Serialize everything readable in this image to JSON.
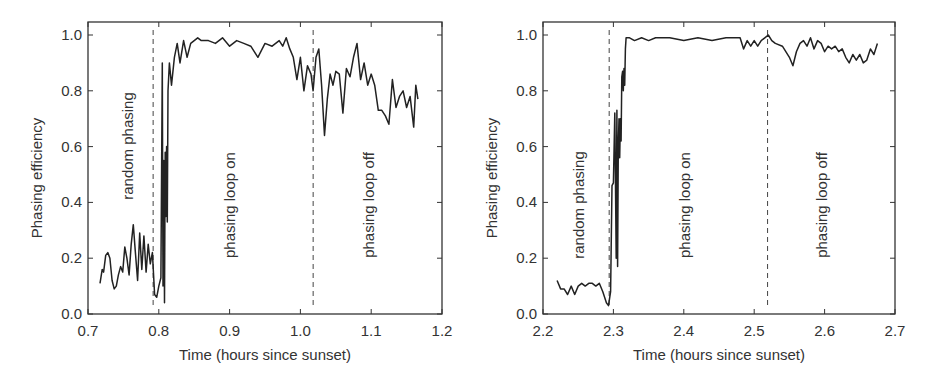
{
  "chart_data": [
    {
      "type": "line",
      "title": "",
      "xlabel": "Time (hours since sunset)",
      "ylabel": "Phasing efficiency",
      "xlim": [
        0.7,
        1.2
      ],
      "ylim": [
        0.0,
        1.05
      ],
      "xticks": [
        "0.7",
        "0.8",
        "0.9",
        "1.0",
        "1.1",
        "1.2"
      ],
      "yticks": [
        "0.0",
        "0.2",
        "0.4",
        "0.6",
        "0.8",
        "1.0"
      ],
      "grid": false,
      "vlines": [
        0.792,
        1.018
      ],
      "regions": [
        "random phasing",
        "phasing loop on",
        "phasing loop off"
      ],
      "series": [
        {
          "name": "phasing efficiency",
          "x": [
            0.717,
            0.72,
            0.722,
            0.725,
            0.728,
            0.731,
            0.734,
            0.737,
            0.74,
            0.743,
            0.746,
            0.749,
            0.752,
            0.755,
            0.758,
            0.761,
            0.764,
            0.767,
            0.77,
            0.773,
            0.776,
            0.779,
            0.782,
            0.785,
            0.788,
            0.791,
            0.794,
            0.797,
            0.8,
            0.803,
            0.805,
            0.806,
            0.807,
            0.808,
            0.809,
            0.81,
            0.811,
            0.812,
            0.813,
            0.815,
            0.818,
            0.822,
            0.826,
            0.83,
            0.835,
            0.84,
            0.845,
            0.85,
            0.855,
            0.86,
            0.87,
            0.88,
            0.89,
            0.9,
            0.91,
            0.92,
            0.93,
            0.94,
            0.95,
            0.96,
            0.97,
            0.975,
            0.98,
            0.985,
            0.99,
            0.995,
            1.0,
            1.005,
            1.01,
            1.015,
            1.018,
            1.022,
            1.026,
            1.03,
            1.034,
            1.038,
            1.042,
            1.046,
            1.05,
            1.055,
            1.06,
            1.065,
            1.07,
            1.075,
            1.08,
            1.085,
            1.09,
            1.095,
            1.1,
            1.105,
            1.11,
            1.115,
            1.12,
            1.125,
            1.13,
            1.135,
            1.14,
            1.145,
            1.15,
            1.155,
            1.16,
            1.163,
            1.166
          ],
          "y": [
            0.11,
            0.16,
            0.15,
            0.21,
            0.22,
            0.2,
            0.12,
            0.09,
            0.1,
            0.14,
            0.17,
            0.15,
            0.24,
            0.2,
            0.14,
            0.25,
            0.32,
            0.22,
            0.12,
            0.29,
            0.16,
            0.28,
            0.15,
            0.25,
            0.18,
            0.22,
            0.07,
            0.06,
            0.1,
            0.13,
            0.9,
            0.1,
            0.55,
            0.04,
            0.58,
            0.35,
            0.6,
            0.33,
            0.8,
            0.9,
            0.82,
            0.92,
            0.97,
            0.9,
            0.98,
            0.92,
            0.97,
            0.98,
            0.99,
            0.98,
            0.98,
            0.97,
            0.99,
            0.96,
            0.98,
            0.97,
            0.96,
            0.92,
            0.97,
            0.96,
            0.98,
            0.96,
            0.99,
            0.95,
            0.92,
            0.84,
            0.92,
            0.8,
            0.89,
            0.86,
            0.8,
            0.92,
            0.95,
            0.82,
            0.64,
            0.77,
            0.86,
            0.82,
            0.87,
            0.86,
            0.72,
            0.88,
            0.85,
            0.92,
            0.97,
            0.84,
            0.9,
            0.82,
            0.86,
            0.82,
            0.73,
            0.73,
            0.71,
            0.68,
            0.84,
            0.74,
            0.78,
            0.8,
            0.74,
            0.78,
            0.67,
            0.82,
            0.77
          ]
        }
      ]
    },
    {
      "type": "line",
      "title": "",
      "xlabel": "Time (hours since sunset)",
      "ylabel": "Phasing efficiency",
      "xlim": [
        2.2,
        2.7
      ],
      "ylim": [
        0.0,
        1.05
      ],
      "xticks": [
        "2.2",
        "2.3",
        "2.4",
        "2.5",
        "2.6",
        "2.7"
      ],
      "yticks": [
        "0.0",
        "0.2",
        "0.4",
        "0.6",
        "0.8",
        "1.0"
      ],
      "grid": false,
      "vlines": [
        2.294,
        2.519
      ],
      "regions": [
        "random phasing",
        "phasing loop on",
        "phasing loop off"
      ],
      "series": [
        {
          "name": "phasing efficiency",
          "x": [
            2.22,
            2.225,
            2.23,
            2.235,
            2.24,
            2.245,
            2.25,
            2.255,
            2.26,
            2.265,
            2.27,
            2.275,
            2.28,
            2.285,
            2.29,
            2.293,
            2.296,
            2.298,
            2.3,
            2.302,
            2.304,
            2.305,
            2.306,
            2.307,
            2.308,
            2.309,
            2.31,
            2.311,
            2.312,
            2.313,
            2.314,
            2.315,
            2.316,
            2.317,
            2.318,
            2.32,
            2.323,
            2.33,
            2.34,
            2.35,
            2.36,
            2.38,
            2.4,
            2.42,
            2.44,
            2.46,
            2.48,
            2.485,
            2.49,
            2.495,
            2.5,
            2.505,
            2.51,
            2.515,
            2.52,
            2.525,
            2.53,
            2.54,
            2.55,
            2.555,
            2.56,
            2.565,
            2.57,
            2.575,
            2.58,
            2.585,
            2.59,
            2.595,
            2.6,
            2.605,
            2.61,
            2.615,
            2.62,
            2.625,
            2.63,
            2.635,
            2.64,
            2.645,
            2.65,
            2.655,
            2.66,
            2.665,
            2.67,
            2.675
          ],
          "y": [
            0.12,
            0.09,
            0.09,
            0.07,
            0.1,
            0.07,
            0.1,
            0.11,
            0.1,
            0.11,
            0.11,
            0.1,
            0.11,
            0.08,
            0.04,
            0.03,
            0.08,
            0.46,
            0.47,
            0.72,
            0.2,
            0.73,
            0.17,
            0.6,
            0.7,
            0.56,
            0.7,
            0.62,
            0.85,
            0.87,
            0.8,
            0.88,
            0.82,
            0.95,
            0.99,
            0.99,
            0.99,
            0.98,
            0.99,
            0.98,
            0.99,
            0.99,
            0.98,
            0.99,
            0.98,
            0.99,
            0.99,
            0.95,
            0.98,
            0.96,
            0.98,
            0.96,
            0.98,
            0.99,
            1.0,
            0.98,
            0.97,
            0.96,
            0.92,
            0.89,
            0.94,
            0.97,
            0.98,
            0.96,
            0.99,
            0.95,
            0.98,
            0.97,
            0.94,
            0.96,
            0.95,
            0.96,
            0.94,
            0.95,
            0.92,
            0.9,
            0.93,
            0.91,
            0.93,
            0.9,
            0.91,
            0.95,
            0.93,
            0.97
          ]
        }
      ]
    }
  ],
  "charts": [
    {
      "ylabel": "Phasing efficiency",
      "xlabel": "Time (hours since sunset)",
      "region_labels": [
        "random phasing",
        "phasing loop on",
        "phasing loop off"
      ]
    },
    {
      "ylabel": "Phasing efficiency",
      "xlabel": "Time (hours since sunset)",
      "region_labels": [
        "random phasing",
        "phasing loop on",
        "phasing loop off"
      ]
    }
  ]
}
